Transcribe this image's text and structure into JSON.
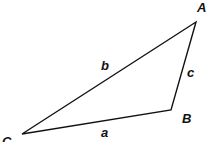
{
  "diagram": {
    "type": "triangle",
    "vertices": [
      {
        "label": "A",
        "x": 196,
        "y": 22,
        "label_x": 197,
        "label_y": 12
      },
      {
        "label": "B",
        "x": 171,
        "y": 110,
        "label_x": 182,
        "label_y": 123
      },
      {
        "label": "C",
        "x": 22,
        "y": 134,
        "label_x": 2,
        "label_y": 146
      }
    ],
    "sides": [
      {
        "label": "a",
        "label_x": 101,
        "label_y": 137
      },
      {
        "label": "b",
        "label_x": 101,
        "label_y": 70
      },
      {
        "label": "c",
        "label_x": 187,
        "label_y": 77
      }
    ],
    "stroke_color": "#111111"
  }
}
